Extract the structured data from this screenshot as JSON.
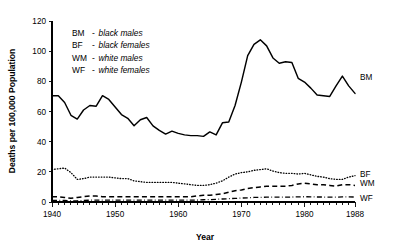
{
  "chart_data": {
    "type": "line",
    "title": "",
    "xlabel": "Year",
    "ylabel": "Deaths per 100,000 Population",
    "xlim": [
      1940,
      1988
    ],
    "ylim": [
      0,
      120
    ],
    "yticks": [
      0,
      20,
      40,
      60,
      80,
      100,
      120
    ],
    "xticks": [
      1940,
      1950,
      1960,
      1970,
      1980,
      1988
    ],
    "xtick_labels": [
      "1940",
      "1950",
      "1960",
      "1970",
      "1980",
      "1988"
    ],
    "ytick_labels": [
      "0",
      "20",
      "40",
      "60",
      "80",
      "100",
      "120"
    ],
    "grid": false,
    "legend_position": "upper-left inside plot; series abbreviations also at right end of each line",
    "x": [
      1940,
      1941,
      1942,
      1943,
      1944,
      1945,
      1946,
      1947,
      1948,
      1949,
      1950,
      1951,
      1952,
      1953,
      1954,
      1955,
      1956,
      1957,
      1958,
      1959,
      1960,
      1961,
      1962,
      1963,
      1964,
      1965,
      1966,
      1967,
      1968,
      1969,
      1970,
      1971,
      1972,
      1973,
      1974,
      1975,
      1976,
      1977,
      1978,
      1979,
      1980,
      1981,
      1982,
      1983,
      1984,
      1985,
      1986,
      1987,
      1988
    ],
    "series": [
      {
        "name": "BM",
        "label": "BM",
        "description": "black males",
        "style": "solid",
        "end_label": "BM",
        "values": [
          70.5,
          70.5,
          66.0,
          57.5,
          55.0,
          61.0,
          64.0,
          63.5,
          70.5,
          68.0,
          63.0,
          58.0,
          55.5,
          50.5,
          54.5,
          56.0,
          50.5,
          47.5,
          45.0,
          47.0,
          45.5,
          44.5,
          44.0,
          44.0,
          43.5,
          46.5,
          44.5,
          52.5,
          53.0,
          64.0,
          79.5,
          97.0,
          104.5,
          107.5,
          103.5,
          95.5,
          92.0,
          93.0,
          92.5,
          82.0,
          79.5,
          75.5,
          71.0,
          70.5,
          70.0,
          77.0,
          83.5,
          77.0,
          72.0
        ]
      },
      {
        "name": "BF",
        "label": "BF",
        "description": "black females",
        "style": "dotted",
        "end_label": "BF",
        "values": [
          21.5,
          22.0,
          22.5,
          19.5,
          15.0,
          15.5,
          16.5,
          16.5,
          16.5,
          16.5,
          16.0,
          15.5,
          15.5,
          14.0,
          13.5,
          13.0,
          13.0,
          13.0,
          13.0,
          13.0,
          12.5,
          12.0,
          11.5,
          11.0,
          11.0,
          11.5,
          12.5,
          14.0,
          16.5,
          18.5,
          19.5,
          20.0,
          21.0,
          21.5,
          22.0,
          20.5,
          19.5,
          19.0,
          19.0,
          18.5,
          19.0,
          18.0,
          17.0,
          16.5,
          15.5,
          15.0,
          15.0,
          16.5,
          17.5
        ]
      },
      {
        "name": "WM",
        "label": "WM",
        "description": "white males",
        "style": "dashed",
        "end_label": "WM",
        "values": [
          3.5,
          3.5,
          3.0,
          2.5,
          3.0,
          3.5,
          4.0,
          4.0,
          3.5,
          3.5,
          3.5,
          3.5,
          3.5,
          3.5,
          3.5,
          3.5,
          3.5,
          3.5,
          3.5,
          3.5,
          3.5,
          3.5,
          3.5,
          4.0,
          4.5,
          4.5,
          5.0,
          5.5,
          6.5,
          7.5,
          8.0,
          9.0,
          9.5,
          10.0,
          10.5,
          10.5,
          10.5,
          10.5,
          11.0,
          12.0,
          12.5,
          12.0,
          11.5,
          11.5,
          11.0,
          10.5,
          11.5,
          11.5,
          11.0
        ]
      },
      {
        "name": "WF",
        "label": "WF",
        "description": "white females",
        "style": "dash-dot",
        "end_label": "WF",
        "values": [
          1.0,
          1.0,
          1.0,
          0.8,
          0.8,
          1.0,
          1.2,
          1.2,
          1.2,
          1.2,
          1.2,
          1.2,
          1.2,
          1.2,
          1.2,
          1.2,
          1.2,
          1.2,
          1.2,
          1.2,
          1.2,
          1.2,
          1.2,
          1.3,
          1.5,
          1.6,
          1.8,
          2.0,
          2.2,
          2.4,
          2.6,
          2.8,
          3.0,
          3.1,
          3.2,
          3.2,
          3.2,
          3.2,
          3.3,
          3.4,
          3.5,
          3.4,
          3.3,
          3.3,
          3.2,
          3.2,
          3.4,
          3.4,
          3.3
        ]
      }
    ],
    "legend_entries": [
      {
        "key": "BM",
        "dash": "-",
        "desc": "black males"
      },
      {
        "key": "BF",
        "dash": "-",
        "desc": "black females"
      },
      {
        "key": "WM",
        "dash": "-",
        "desc": "white males"
      },
      {
        "key": "WF",
        "dash": "-",
        "desc": "white females"
      }
    ]
  }
}
